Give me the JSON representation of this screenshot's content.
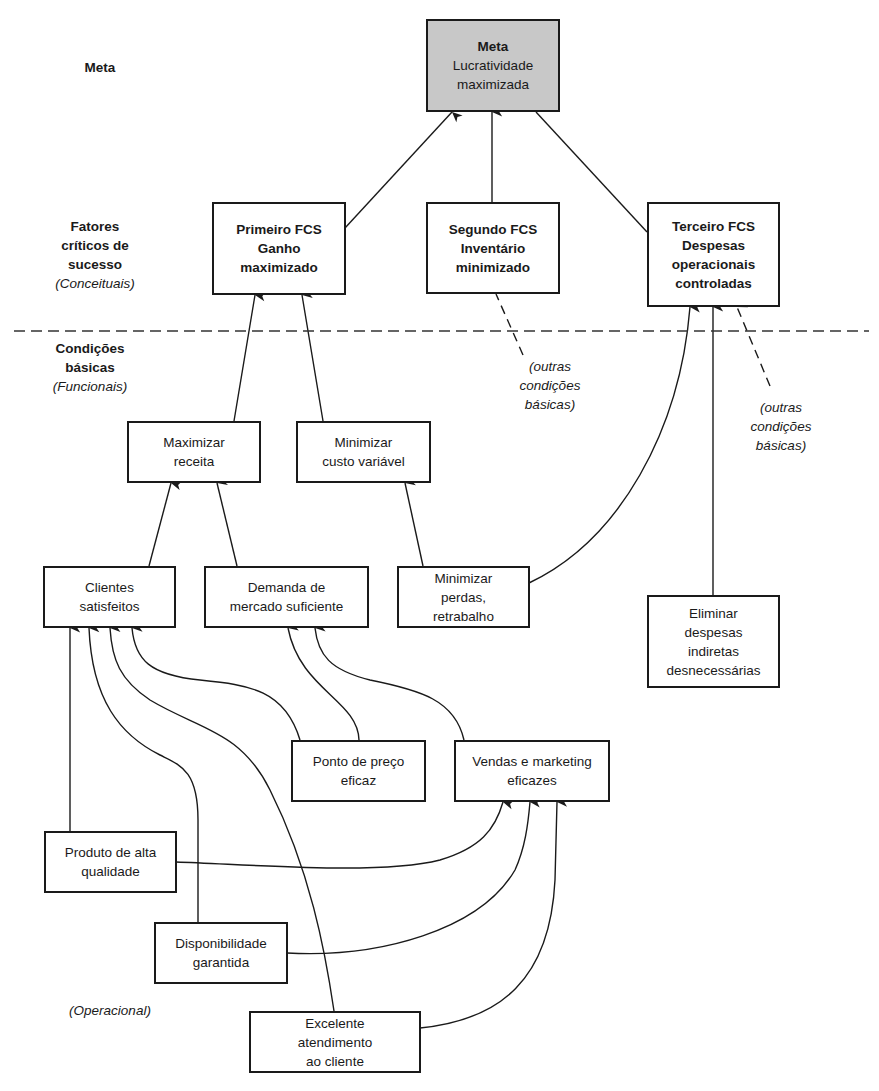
{
  "levels": {
    "goal": {
      "title": "Meta"
    },
    "csf": {
      "title_lines": [
        "Fatores",
        "críticos de",
        "sucesso"
      ],
      "subtitle": "(Conceituais)"
    },
    "necessary": {
      "title_lines": [
        "Condições",
        "básicas"
      ],
      "subtitle": "(Funcionais)"
    },
    "operational": {
      "subtitle": "(Operacional)"
    }
  },
  "nodes": {
    "goal": {
      "title": "Meta",
      "lines": [
        "Lucratividade",
        "maximizada"
      ]
    },
    "csf1": {
      "lines": [
        "Primeiro FCS",
        "Ganho",
        "maximizado"
      ]
    },
    "csf2": {
      "lines": [
        "Segundo FCS",
        "Inventário",
        "minimizado"
      ]
    },
    "csf3": {
      "lines": [
        "Terceiro FCS",
        "Despesas",
        "operacionais",
        "controladas"
      ]
    },
    "max_receita": {
      "lines": [
        "Maximizar",
        "receita"
      ]
    },
    "min_custo": {
      "lines": [
        "Minimizar",
        "custo variável"
      ]
    },
    "clientes": {
      "lines": [
        "Clientes",
        "satisfeitos"
      ]
    },
    "demanda": {
      "lines": [
        "Demanda de",
        "mercado suficiente"
      ]
    },
    "min_perdas": {
      "lines": [
        "Minimizar",
        "perdas,",
        "retrabalho"
      ]
    },
    "eliminar": {
      "lines": [
        "Eliminar",
        "despesas",
        "indiretas",
        "desnecessárias"
      ]
    },
    "ponto_preco": {
      "lines": [
        "Ponto de preço",
        "eficaz"
      ]
    },
    "vendas": {
      "lines": [
        "Vendas e marketing",
        "eficazes"
      ]
    },
    "produto": {
      "lines": [
        "Produto de alta",
        "qualidade"
      ]
    },
    "disponibilidade": {
      "lines": [
        "Disponibilidade",
        "garantida"
      ]
    },
    "excelente": {
      "lines": [
        "Excelente",
        "atendimento",
        "ao cliente"
      ]
    }
  },
  "notes": {
    "other1": {
      "lines": [
        "(outras",
        "condições",
        "básicas)"
      ]
    },
    "other2": {
      "lines": [
        "(outras",
        "condições",
        "básicas)"
      ]
    }
  },
  "colors": {
    "line": "#1a1a1a",
    "goal_fill": "#c8c8c8",
    "divider": "#333333"
  }
}
